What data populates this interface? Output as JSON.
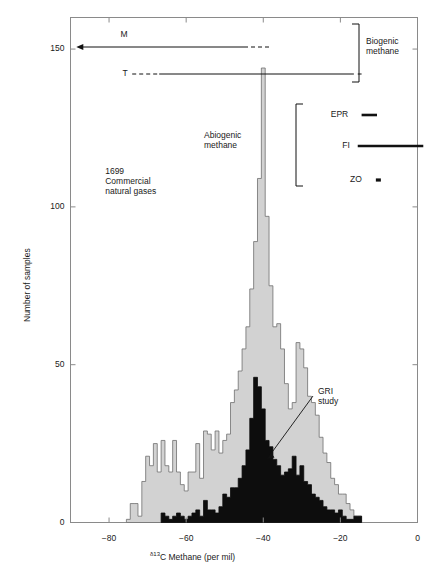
{
  "chart_data": {
    "type": "bar",
    "title": "",
    "xlabel": "δ13C Methane (per mil)",
    "xlabel_parts": {
      "delta": "δ13",
      "rest": "C Methane (per mil)"
    },
    "ylabel": "Number of samples",
    "xlim": [
      -90,
      0
    ],
    "ylim": [
      0,
      160
    ],
    "xticks": [
      -80,
      -60,
      -40,
      -20,
      0
    ],
    "xtick_labels": [
      "−80",
      "−60",
      "−40",
      "−20",
      "0"
    ],
    "yticks": [
      0,
      50,
      100,
      150
    ],
    "ytick_labels": [
      "0",
      "50",
      "100",
      "150"
    ],
    "grid": false,
    "legend_position": "none",
    "bin_width": 1,
    "series": [
      {
        "name": "1699 Commercial natural gases",
        "color": "#d2d2d2",
        "edge_color": "#6e6e6e",
        "x": [
          -75,
          -74,
          -73,
          -72,
          -71,
          -70,
          -69,
          -68,
          -67,
          -66,
          -65,
          -64,
          -63,
          -62,
          -61,
          -60,
          -59,
          -58,
          -57,
          -56,
          -55,
          -54,
          -53,
          -52,
          -51,
          -50,
          -49,
          -48,
          -47,
          -46,
          -45,
          -44,
          -43,
          -42,
          -41,
          -40,
          -39,
          -38,
          -37,
          -36,
          -35,
          -34,
          -33,
          -32,
          -31,
          -30,
          -29,
          -28,
          -27,
          -26,
          -25,
          -24,
          -23,
          -22,
          -21,
          -20,
          -19,
          -18,
          -17,
          -16,
          -15
        ],
        "values": [
          1,
          6,
          6,
          2,
          13,
          21,
          18,
          25,
          16,
          26,
          18,
          16,
          26,
          16,
          12,
          10,
          16,
          16,
          25,
          14,
          29,
          28,
          23,
          29,
          22,
          26,
          28,
          38,
          42,
          48,
          55,
          62,
          74,
          89,
          109,
          144,
          97,
          75,
          62,
          63,
          55,
          44,
          36,
          38,
          57,
          55,
          49,
          40,
          38,
          34,
          27,
          22,
          19,
          14,
          12,
          9,
          9,
          6,
          4,
          2,
          2
        ]
      },
      {
        "name": "GRI study",
        "color": "#0d0d0d",
        "edge_color": "#0d0d0d",
        "x": [
          -66,
          -65,
          -64,
          -63,
          -62,
          -61,
          -60,
          -59,
          -58,
          -57,
          -56,
          -55,
          -54,
          -53,
          -52,
          -51,
          -50,
          -49,
          -48,
          -47,
          -46,
          -45,
          -44,
          -43,
          -42,
          -41,
          -40,
          -39,
          -38,
          -37,
          -36,
          -35,
          -34,
          -33,
          -32,
          -31,
          -30,
          -29,
          -28,
          -27,
          -26,
          -25,
          -24,
          -23,
          -22,
          -21,
          -20,
          -19,
          -18,
          -17,
          -16,
          -15
        ],
        "values": [
          3,
          2,
          1,
          2,
          3,
          2,
          1,
          2,
          3,
          4,
          2,
          7,
          4,
          4,
          3,
          5,
          9,
          8,
          11,
          11,
          14,
          18,
          23,
          33,
          46,
          43,
          36,
          26,
          24,
          20,
          18,
          15,
          16,
          17,
          21,
          15,
          18,
          13,
          12,
          9,
          8,
          7,
          5,
          4,
          4,
          3,
          4,
          2,
          1,
          1,
          2,
          2
        ]
      }
    ],
    "annotations": [
      {
        "name": "sample-count-note",
        "text": "1699\nCommercial\nnatural gases",
        "x": -81,
        "y": 113
      },
      {
        "name": "gri-study-label",
        "text": "GRI\nstudy",
        "x": -28,
        "y": 62
      }
    ],
    "range_bars": [
      {
        "name": "M",
        "label": "M",
        "solid_from": -88.5,
        "solid_to": -45,
        "dashed_from": -45,
        "dashed_to": -38,
        "arrow": "left"
      },
      {
        "name": "T",
        "label": "T",
        "dashed_from": -74,
        "dashed_to": -67,
        "solid_from": -67,
        "solid_to": -16.5,
        "dash_tip_from": -15.5,
        "dash_tip_to": -14.5,
        "arrow": "none"
      },
      {
        "name": "EPR",
        "label": "EPR",
        "from": -14.5,
        "to": -10.5
      },
      {
        "name": "FI",
        "label": "FI",
        "from": -15.5,
        "to": 1.5
      },
      {
        "name": "ZO",
        "label": "ZO",
        "from": -10.8,
        "to": -9.5
      }
    ],
    "group_labels": [
      {
        "name": "biogenic-methane",
        "text": "Biogenic\nmethane"
      },
      {
        "name": "abiogenic-methane",
        "text": "Abiogenic\nmethane"
      }
    ]
  },
  "axes": {
    "frame_color": "#8a8a8a",
    "tick_color": "#8a8a8a"
  }
}
